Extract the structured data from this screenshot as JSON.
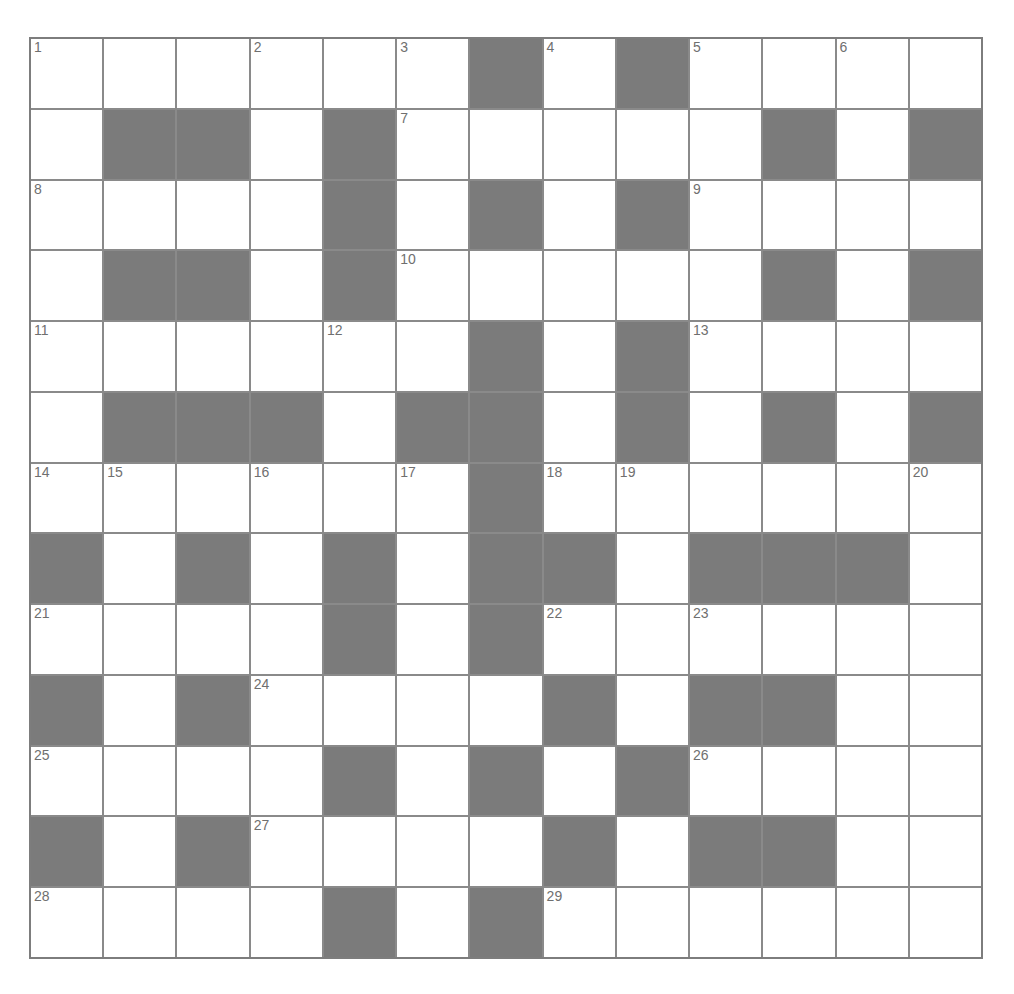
{
  "puzzle": {
    "rows": 13,
    "cols": 13,
    "colors": {
      "block": "#7b7b7b",
      "cell": "#ffffff",
      "line": "#8a8a8a",
      "number": "#6f6f6f"
    },
    "layout": [
      "......#.#....",
      ".##.#.....#.#",
      "....#.#.#....",
      ".##.#.....#.#",
      "......#.#....",
      ".###.##.#.#.#",
      "......#......",
      "#.#.#.##.###.",
      "....#.#......",
      "#.#....#.##..",
      "....#.#.#....",
      "#.#....#.##..",
      "....#.#......"
    ],
    "numbers": [
      {
        "r": 0,
        "c": 0,
        "n": "1"
      },
      {
        "r": 0,
        "c": 3,
        "n": "2"
      },
      {
        "r": 0,
        "c": 5,
        "n": "3"
      },
      {
        "r": 0,
        "c": 7,
        "n": "4"
      },
      {
        "r": 0,
        "c": 9,
        "n": "5"
      },
      {
        "r": 0,
        "c": 11,
        "n": "6"
      },
      {
        "r": 1,
        "c": 5,
        "n": "7"
      },
      {
        "r": 2,
        "c": 0,
        "n": "8"
      },
      {
        "r": 2,
        "c": 9,
        "n": "9"
      },
      {
        "r": 3,
        "c": 5,
        "n": "10"
      },
      {
        "r": 4,
        "c": 0,
        "n": "11"
      },
      {
        "r": 4,
        "c": 4,
        "n": "12"
      },
      {
        "r": 4,
        "c": 9,
        "n": "13"
      },
      {
        "r": 6,
        "c": 0,
        "n": "14"
      },
      {
        "r": 6,
        "c": 1,
        "n": "15"
      },
      {
        "r": 6,
        "c": 3,
        "n": "16"
      },
      {
        "r": 6,
        "c": 5,
        "n": "17"
      },
      {
        "r": 6,
        "c": 7,
        "n": "18"
      },
      {
        "r": 6,
        "c": 8,
        "n": "19"
      },
      {
        "r": 6,
        "c": 12,
        "n": "20"
      },
      {
        "r": 8,
        "c": 0,
        "n": "21"
      },
      {
        "r": 8,
        "c": 7,
        "n": "22"
      },
      {
        "r": 8,
        "c": 9,
        "n": "23"
      },
      {
        "r": 9,
        "c": 3,
        "n": "24"
      },
      {
        "r": 10,
        "c": 0,
        "n": "25"
      },
      {
        "r": 10,
        "c": 9,
        "n": "26"
      },
      {
        "r": 11,
        "c": 3,
        "n": "27"
      },
      {
        "r": 12,
        "c": 0,
        "n": "28"
      },
      {
        "r": 12,
        "c": 7,
        "n": "29"
      }
    ]
  }
}
